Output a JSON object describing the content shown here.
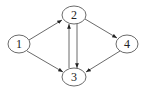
{
  "diagram": {
    "type": "directed-graph",
    "nodes": [
      {
        "id": "1",
        "label": "1",
        "x": 19,
        "y": 44
      },
      {
        "id": "2",
        "label": "2",
        "x": 74,
        "y": 15
      },
      {
        "id": "3",
        "label": "3",
        "x": 74,
        "y": 77
      },
      {
        "id": "4",
        "label": "4",
        "x": 127,
        "y": 44
      }
    ],
    "edges": [
      {
        "from": "1",
        "to": "2"
      },
      {
        "from": "1",
        "to": "3"
      },
      {
        "from": "2",
        "to": "4"
      },
      {
        "from": "2",
        "to": "3"
      },
      {
        "from": "3",
        "to": "2"
      },
      {
        "from": "4",
        "to": "3"
      }
    ],
    "colors": {
      "stroke": "#333333",
      "fill": "#ffffff"
    }
  }
}
